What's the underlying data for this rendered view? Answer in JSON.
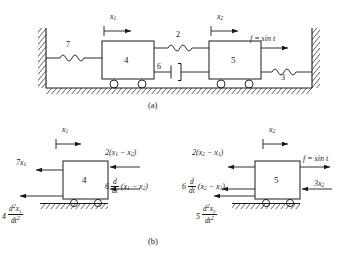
{
  "figure": {
    "captions": [
      {
        "id": "cap-a",
        "text": "(a)"
      },
      {
        "id": "cap-b",
        "text": "(b)"
      }
    ]
  },
  "panel_a": {
    "name": "schematic-two-mass-spring-damper",
    "masses": [
      {
        "id": "mass-1",
        "label": "4"
      },
      {
        "id": "mass-2",
        "label": "5"
      }
    ],
    "springs": [
      {
        "id": "spring-left-wall",
        "label": "7"
      },
      {
        "id": "spring-coupling",
        "label": "2"
      },
      {
        "id": "spring-right-wall",
        "label": "3"
      }
    ],
    "dampers": [
      {
        "id": "damper-coupling",
        "label": "6"
      }
    ],
    "displacements": [
      {
        "id": "x1-arrow",
        "label_html": "x<sub>1</sub>"
      },
      {
        "id": "x2-arrow",
        "label_html": "x<sub>2</sub>"
      }
    ],
    "force": {
      "id": "applied-force",
      "label_html": "f = sin t"
    }
  },
  "panel_b": {
    "name": "free-body-diagrams",
    "left_body": {
      "mass_label": "4",
      "displacement_html": "x<sub>1</sub>",
      "forces": [
        {
          "id": "spring-force-7x1",
          "label_html": "7x<sub>1</sub>",
          "direction": "left"
        },
        {
          "id": "inertia-force-left",
          "label_html": "4 <span class=\"frac\"><span class=\"n\"><i>d</i><sup>2</sup><i>x</i><sub>1</sub></span><span class=\"d\"><i>dt</i><sup>2</sup></span></span>",
          "direction": "left"
        },
        {
          "id": "spring-force-coupling-left",
          "label_html": "2(x<sub>1</sub> &minus; x<sub>2</sub>)",
          "direction": "left"
        },
        {
          "id": "damper-force-coupling-left",
          "label_html": "6 <span class=\"frac\"><span class=\"n\"><i>d</i></span><span class=\"d\"><i>dt</i></span></span> (x<sub>1</sub> &minus; x<sub>2</sub>)",
          "direction": "left"
        }
      ]
    },
    "right_body": {
      "mass_label": "5",
      "displacement_html": "x<sub>2</sub>",
      "forces": [
        {
          "id": "spring-force-coupling-right",
          "label_html": "2(x<sub>2</sub> &minus; x<sub>1</sub>)",
          "direction": "left"
        },
        {
          "id": "damper-force-coupling-right",
          "label_html": "6 <span class=\"frac\"><span class=\"n\"><i>d</i></span><span class=\"d\"><i>dt</i></span></span> (x<sub>2</sub> &minus; x<sub>1</sub>)",
          "direction": "left"
        },
        {
          "id": "inertia-force-right",
          "label_html": "5 <span class=\"frac\"><span class=\"n\"><i>d</i><sup>2</sup><i>x</i><sub>2</sub></span><span class=\"d\"><i>dt</i><sup>2</sup></span></span>",
          "direction": "left"
        },
        {
          "id": "applied-force-right",
          "label_html": "f = sin t",
          "direction": "right"
        },
        {
          "id": "spring-force-3x2",
          "label_html": "3x<sub>2</sub>",
          "direction": "left"
        }
      ]
    }
  },
  "colors": {
    "stroke": "#1a1a1a",
    "background": "#ffffff"
  }
}
